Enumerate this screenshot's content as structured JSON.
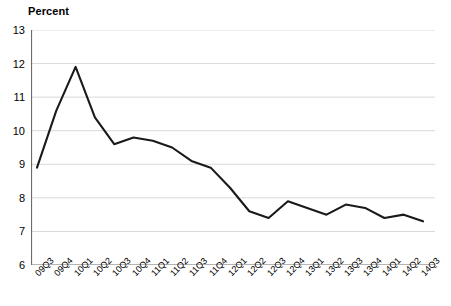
{
  "axis": {
    "ylabel": "Percent",
    "yticks": [
      "13",
      "12",
      "11",
      "10",
      "9",
      "8",
      "7",
      "6"
    ],
    "xticks": [
      "09Q3",
      "09Q4",
      "10Q1",
      "10Q2",
      "10Q3",
      "10Q4",
      "11Q1",
      "11Q2",
      "11Q3",
      "11Q4",
      "12Q1",
      "12Q2",
      "12Q3",
      "12Q4",
      "13Q1",
      "13Q2",
      "13Q3",
      "13Q4",
      "14Q1",
      "14Q2",
      "14Q3"
    ]
  },
  "style": {
    "line_color": "#1a1a1a",
    "grid_color": "#d9d9d9",
    "axis_color": "#6b6b6b",
    "background": "#ffffff"
  },
  "chart_data": {
    "type": "line",
    "title": "",
    "subtitle": "",
    "xlabel": "",
    "ylabel": "Percent",
    "ylim": [
      6,
      13
    ],
    "ytick_step": 1,
    "grid": true,
    "legend": false,
    "categories": [
      "09Q3",
      "09Q4",
      "10Q1",
      "10Q2",
      "10Q3",
      "10Q4",
      "11Q1",
      "11Q2",
      "11Q3",
      "11Q4",
      "12Q1",
      "12Q2",
      "12Q3",
      "12Q4",
      "13Q1",
      "13Q2",
      "13Q3",
      "13Q4",
      "14Q1",
      "14Q2",
      "14Q3"
    ],
    "values": [
      8.9,
      10.6,
      11.9,
      10.4,
      9.6,
      9.8,
      9.7,
      9.5,
      9.1,
      8.9,
      8.3,
      7.6,
      7.4,
      7.9,
      7.7,
      7.5,
      7.8,
      7.7,
      7.4,
      7.5,
      7.3
    ],
    "series": [
      {
        "name": "Percent",
        "values": [
          8.9,
          10.6,
          11.9,
          10.4,
          9.6,
          9.8,
          9.7,
          9.5,
          9.1,
          8.9,
          8.3,
          7.6,
          7.4,
          7.9,
          7.7,
          7.5,
          7.8,
          7.7,
          7.4,
          7.5,
          7.3
        ]
      }
    ]
  }
}
